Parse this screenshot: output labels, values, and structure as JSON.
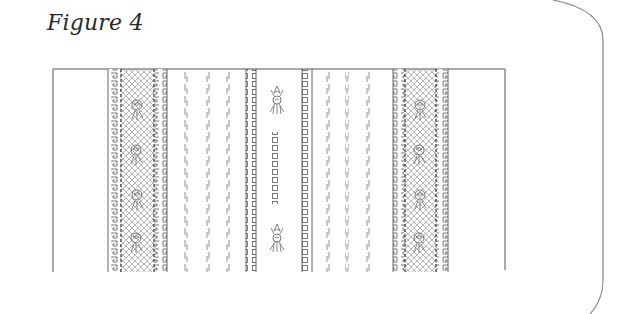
{
  "caption": "Figure 4",
  "figure": {
    "bands": [
      {
        "type": "lace-insertion",
        "motif": "rose"
      },
      {
        "type": "pin-tucks",
        "count": 3
      },
      {
        "type": "ladder-insertion"
      },
      {
        "type": "centre-motif",
        "elements": [
          "rose-sprig",
          "square-eyelets",
          "rose-sprig"
        ]
      },
      {
        "type": "ladder-insertion"
      },
      {
        "type": "pin-tucks",
        "count": 3
      },
      {
        "type": "lace-insertion",
        "motif": "rose"
      }
    ],
    "line_color": "#555555"
  }
}
